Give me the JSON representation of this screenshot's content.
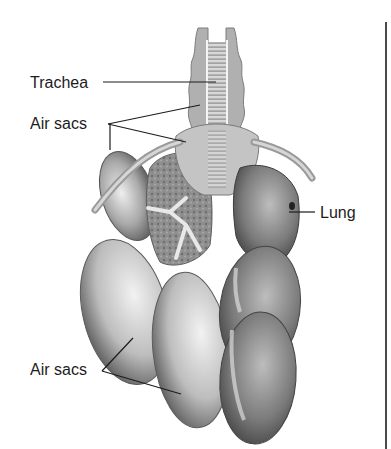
{
  "figure": {
    "labels": {
      "trachea": "Trachea",
      "air_sacs_upper": "Air sacs",
      "lung": "Lung",
      "air_sacs_lower": "Air sacs"
    },
    "colors": {
      "background": "#ffffff",
      "label_text": "#1c1c1c",
      "leader_line": "#1c1c1c",
      "organ_dark": "#3c3c3c",
      "organ_mid": "#8a8a8a",
      "organ_light": "#e4e4e4",
      "frame_rule": "#4a4a4a"
    }
  }
}
